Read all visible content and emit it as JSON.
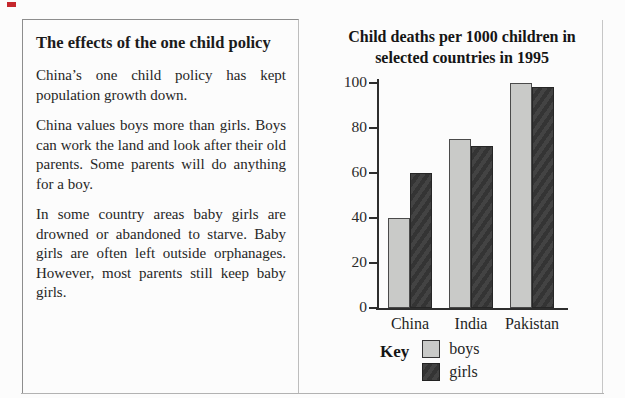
{
  "article": {
    "title": "The effects of the one child policy",
    "paragraphs": [
      "China’s one child policy has kept population growth down.",
      "China values boys more than girls. Boys can work the land and look after their old parents.  Some parents will do anything for a boy.",
      "In some country areas baby girls are drowned or abandoned to starve. Baby girls are often left outside orphanages.  However, most parents still keep baby girls."
    ]
  },
  "chart_data": {
    "type": "bar",
    "title": "Child deaths per 1000 children in selected countries in 1995",
    "title_lines": [
      "Child deaths per 1000 children in",
      "selected countries in 1995"
    ],
    "categories": [
      "China",
      "India",
      "Pakistan"
    ],
    "series": [
      {
        "name": "boys",
        "color": "#c9cac8",
        "values": [
          40,
          75,
          100
        ]
      },
      {
        "name": "girls",
        "color": "#3d3d3d",
        "values": [
          60,
          72,
          98
        ]
      }
    ],
    "ylim": [
      0,
      100
    ],
    "yticks": [
      0,
      20,
      40,
      60,
      80,
      100
    ],
    "xlabel": "",
    "ylabel": "",
    "grid": false,
    "legend_title": "Key",
    "legend_position": "bottom"
  },
  "colors": {
    "boys_bar": "#c9cac8",
    "girls_bar": "#3d3d3d",
    "axis": "#2e2e2e",
    "corner_mark": "#c5272d"
  }
}
